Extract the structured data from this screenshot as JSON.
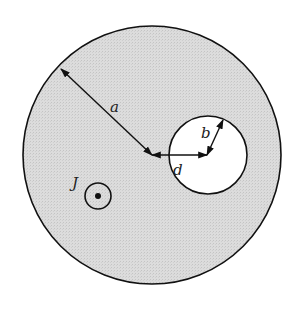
{
  "figure": {
    "labels": {
      "outer_radius": "a",
      "hole_radius": "b",
      "offset": "d",
      "current_density": "J"
    },
    "current_direction": "out-of-page",
    "colors": {
      "conductor_fill": "#d9d9d9",
      "hole_fill": "#ffffff",
      "stroke": "#111111"
    }
  }
}
